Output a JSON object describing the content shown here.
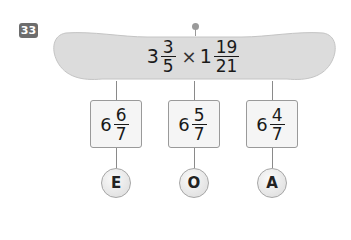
{
  "problem": {
    "number": "33",
    "expression": {
      "term1": {
        "whole": "3",
        "numerator": "3",
        "denominator": "5"
      },
      "operator": "×",
      "term2": {
        "whole": "1",
        "numerator": "19",
        "denominator": "21"
      }
    }
  },
  "choices": [
    {
      "whole": "6",
      "numerator": "6",
      "denominator": "7",
      "letter": "E"
    },
    {
      "whole": "6",
      "numerator": "5",
      "denominator": "7",
      "letter": "O"
    },
    {
      "whole": "6",
      "numerator": "4",
      "denominator": "7",
      "letter": "A"
    }
  ],
  "colors": {
    "tray": "#dcdcdc",
    "badge": "#6d6d6d",
    "box_border": "#9a9a9a"
  }
}
